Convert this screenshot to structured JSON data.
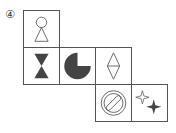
{
  "option_label": "④",
  "net": {
    "description": "Cube net with six faces",
    "faces": [
      {
        "id": "top",
        "row": 0,
        "col": 0,
        "symbol": "circle-over-triangle",
        "fill": "outline"
      },
      {
        "id": "left",
        "row": 1,
        "col": 0,
        "symbol": "hourglass",
        "fill": "#444444"
      },
      {
        "id": "center",
        "row": 1,
        "col": 1,
        "symbol": "pac-circle-three-quarter",
        "fill": "#444444"
      },
      {
        "id": "right",
        "row": 1,
        "col": 2,
        "symbol": "diamond-split",
        "fill": "outline"
      },
      {
        "id": "bottom",
        "row": 2,
        "col": 2,
        "symbol": "prohibition-sign",
        "fill": "outline"
      },
      {
        "id": "far",
        "row": 2,
        "col": 3,
        "symbol": "two-four-point-stars",
        "fill": "mixed"
      }
    ]
  },
  "colors": {
    "line": "#555555",
    "fill_dark": "#444444"
  }
}
